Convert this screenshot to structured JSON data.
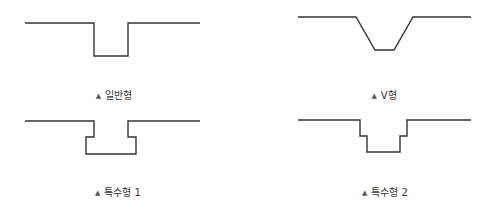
{
  "colors": {
    "stroke": "#333333",
    "text": "#333333",
    "background": "#ffffff"
  },
  "shapes": [
    {
      "id": "general",
      "label": "일반형",
      "marker": "▲",
      "points": "25,23 94,23 94,56 128,56 128,23 200,23",
      "label_x": 114,
      "label_y": 90
    },
    {
      "id": "v-type",
      "label": "V형",
      "marker": "▲",
      "points": "298,17 356,17 375,50 394,50 413,17 471,17",
      "label_x": 384,
      "label_y": 90
    },
    {
      "id": "special-1",
      "label": "특수형 1",
      "marker": "▲",
      "points": "25,121 94,121 94,137 86,137 86,154 136,154 136,137 128,137 128,121 200,121",
      "label_x": 118,
      "label_y": 187
    },
    {
      "id": "special-2",
      "label": "특수형 2",
      "marker": "▲",
      "points": "298,120 360,120 360,136 367,136 367,152 400,152 400,136 407,136 407,120 471,120",
      "label_x": 385,
      "label_y": 187
    }
  ]
}
